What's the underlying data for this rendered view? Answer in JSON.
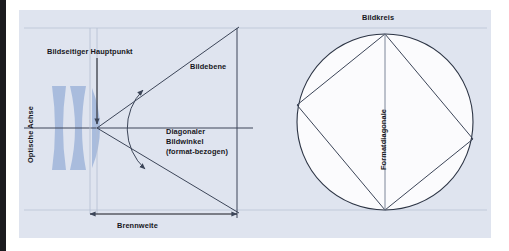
{
  "figure": {
    "kind": "optical-diagram",
    "title_visible": false,
    "background_color": "#dfe4ef",
    "plate_color": "#ffffff",
    "line_color": "#3c4558",
    "glass_color": "#a9bcdd",
    "circle_fill": "#fbfbfd",
    "text_color": "#17171c"
  },
  "labels": {
    "image_side_principal_point": "Bildseitiger Hauptpunkt",
    "image_plane": "Bildebene",
    "diagonal_angle_of_view": "Diagonaler Bildwinkel (format-bezogen)",
    "focal_length": "Brennweite",
    "optical_axis": "Optische Achse",
    "image_circle": "Bildkreis",
    "format_diagonal": "Formatdiagonale"
  },
  "geometry": {
    "principal_point": {
      "x": 97,
      "y": 128
    },
    "image_plane_x": 237,
    "image_plane_top_y": 28,
    "image_plane_bottom_y": 218,
    "optical_axis_y": 128,
    "focal_length_dimension": {
      "from_x": 90,
      "to_x": 237,
      "y": 214
    },
    "image_circle": {
      "center_x": 385,
      "center_y": 122,
      "radius": 88
    },
    "format_rectangle_vertices": [
      {
        "name": "top",
        "x": 385,
        "y": 34
      },
      {
        "name": "left",
        "x": 297,
        "y": 105
      },
      {
        "name": "bottom",
        "x": 385,
        "y": 210
      },
      {
        "name": "right",
        "x": 473,
        "y": 139
      }
    ],
    "format_diagonal_line": {
      "from_x": 385,
      "from_y": 34,
      "to_x": 385,
      "to_y": 210
    },
    "angle_arc": {
      "center_x": 97,
      "center_y": 128,
      "radius": 54
    }
  },
  "lens_elements": [
    {
      "name": "front-biconcave-element",
      "cx": 59,
      "top": 86,
      "bottom": 170,
      "left_bulge": 6,
      "right_bulge": -7
    },
    {
      "name": "middle-biconcave-element",
      "cx": 76,
      "top": 86,
      "bottom": 170,
      "left_bulge": -7,
      "right_bulge": -7
    },
    {
      "name": "rear-convex-element",
      "cx": 100,
      "top": 88,
      "bottom": 168,
      "left_bulge": 0,
      "right_bulge": 8
    }
  ],
  "icons": {
    "principal_point_pointer": "down-arrow-icon",
    "angle_marker": "double-headed-arc-arrow-icon",
    "focal_length_dimension": "double-headed-arrow-icon"
  }
}
